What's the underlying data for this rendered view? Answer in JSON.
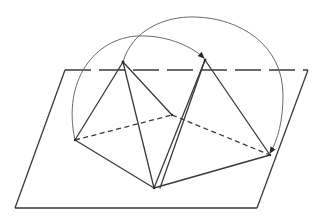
{
  "diagram": {
    "title": "",
    "colors": {
      "stroke": "#3a3a3a",
      "arc": "#6a6a6a",
      "background": "#ffffff"
    },
    "plane": {
      "corners": [
        [
          65,
          70
        ],
        [
          308,
          70
        ],
        [
          257,
          208
        ],
        [
          15,
          208
        ]
      ],
      "top_edge_style": "dashed"
    },
    "vertices": {
      "apex_left": [
        123,
        62
      ],
      "apex_right": [
        205,
        60
      ],
      "left": [
        75,
        140
      ],
      "bottom": [
        154,
        188
      ],
      "right": [
        270,
        155
      ],
      "center": [
        172,
        115
      ]
    },
    "solid_edges": [
      [
        "apex_left",
        "left"
      ],
      [
        "apex_left",
        "bottom"
      ],
      [
        "apex_left",
        "center"
      ],
      [
        "apex_right",
        "bottom"
      ],
      [
        "apex_right",
        "center"
      ],
      [
        "apex_right",
        "right"
      ],
      [
        "left",
        "bottom"
      ],
      [
        "bottom",
        "right"
      ]
    ],
    "dashed_edges": [
      [
        "left",
        "center"
      ],
      [
        "center",
        "right"
      ]
    ],
    "arcs": [
      {
        "from": "left",
        "to": "apex_right",
        "arrow": "end"
      },
      {
        "from": "apex_left",
        "to": "right",
        "arrow": "end"
      }
    ]
  }
}
